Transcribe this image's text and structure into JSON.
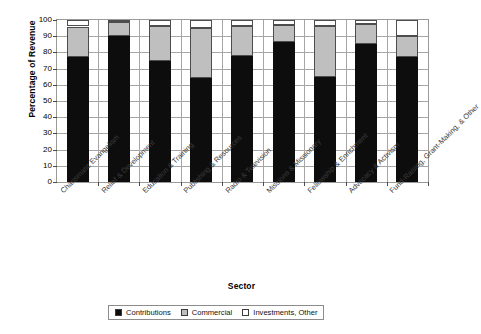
{
  "chart_data": {
    "type": "bar",
    "subtype": "stacked-100",
    "title": "",
    "xlabel": "Sector",
    "ylabel": "Percentage of Revenue",
    "ylim": [
      0,
      100
    ],
    "ytick_step": 10,
    "yticks": [
      100,
      90,
      80,
      70,
      60,
      50,
      40,
      30,
      20,
      10,
      0
    ],
    "grid": true,
    "legend_position": "bottom",
    "categories": [
      "Charismatic Evangelism",
      "Relief & Development",
      "Education & Training",
      "Publishing & Resources",
      "Radio & Television",
      "Missions & Missionary",
      "Fellowship & Enrichment",
      "Advocacy & Activism",
      "Fund-Raising, Grant-Making, & Other"
    ],
    "series": [
      {
        "name": "Contributions",
        "color": "#0d0d0d",
        "values": [
          77,
          90,
          75,
          64,
          78,
          86.5,
          65,
          85,
          77
        ]
      },
      {
        "name": "Commercial",
        "color": "#bfbfbf",
        "values": [
          19,
          9,
          21.5,
          31,
          18.5,
          10.5,
          31,
          12.5,
          13
        ]
      },
      {
        "name": "Investments, Other",
        "color": "#ffffff",
        "values": [
          4,
          1,
          3.5,
          5,
          3.5,
          3,
          4,
          2.5,
          10
        ]
      }
    ]
  },
  "legend": {
    "items": [
      {
        "label": "Contributions",
        "swatch": "#0d0d0d"
      },
      {
        "label": "Commercial",
        "swatch": "#bfbfbf"
      },
      {
        "label": "Investments, Other",
        "swatch": "#ffffff"
      }
    ]
  }
}
